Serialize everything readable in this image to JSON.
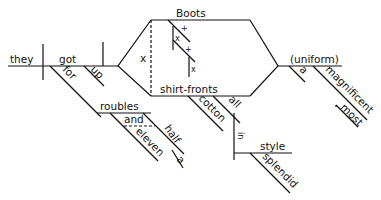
{
  "diagram": {
    "type": "sentence-diagram (Reed-Kellogg)",
    "colors": {
      "ink": "#111111",
      "background": "#ffffff"
    },
    "words": {
      "subject": "they",
      "verb": "got",
      "particle": "up",
      "prep_for": "for",
      "roubles": "roubles",
      "and": "and",
      "eleven": "eleven",
      "half": "half",
      "a_half": "a",
      "boots": "Boots",
      "shirt_fronts": "shirt-fronts",
      "cotton": "cotton",
      "all": "all",
      "conj_x": "x",
      "boots_plus1": "+",
      "boots_x1": "x",
      "boots_plus2": "+",
      "boots_x2": "x",
      "uniform": "(uniform)",
      "a_uniform": "a",
      "magnificent": "magnificent",
      "most": "most",
      "in": "in",
      "style": "style",
      "splendid": "splendid"
    }
  }
}
